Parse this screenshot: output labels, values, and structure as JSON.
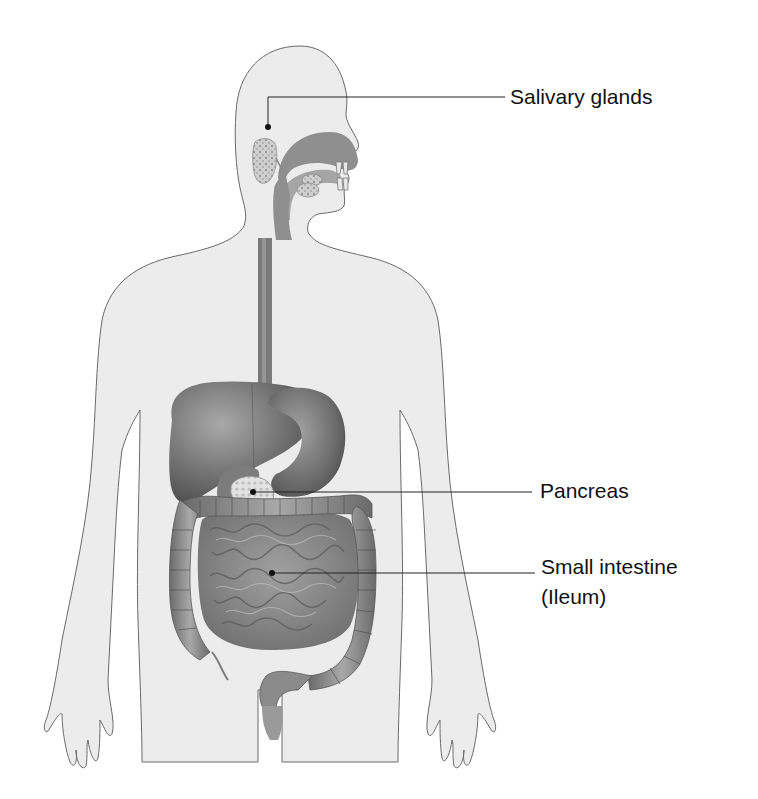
{
  "diagram": {
    "colors": {
      "background": "#ffffff",
      "body_fill": "#ececec",
      "body_outline": "#6a6a6a",
      "organ_dark": "#5e5e5e",
      "organ_mid": "#8a8a8a",
      "organ_light": "#b5b5b5",
      "gland_fill": "#c8c8c8",
      "leader_line": "#222222",
      "label_text": "#111111"
    },
    "labels": [
      {
        "id": "salivary-glands",
        "text": "Salivary glands",
        "x": 510,
        "y": 84
      },
      {
        "id": "pancreas",
        "text": "Pancreas",
        "x": 540,
        "y": 478
      },
      {
        "id": "small-intestine",
        "text": "Small intestine",
        "line2": "(Ileum)",
        "x": 541,
        "y": 554
      }
    ],
    "leaders": [
      {
        "target": "salivary-glands",
        "points": "268,127 268,97 505,97",
        "dot": [
          268,
          127
        ]
      },
      {
        "target": "pancreas",
        "points": "253,492 532,492",
        "dot": [
          253,
          492
        ]
      },
      {
        "target": "small-intestine",
        "points": "272,573 535,573",
        "dot": [
          272,
          573
        ]
      }
    ]
  }
}
